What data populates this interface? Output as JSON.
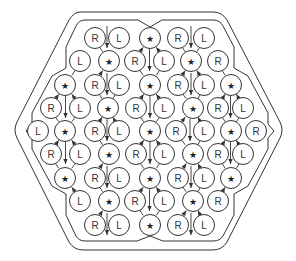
{
  "diagram": {
    "title": "",
    "colors": {
      "stroke": "#333333",
      "fill": "#ffffff",
      "text": "#333333"
    },
    "circle_radius": 10.5,
    "rows": [
      {
        "y": 38,
        "cells": [
          {
            "x": 95,
            "t": "R"
          },
          {
            "x": 119,
            "t": "L"
          },
          {
            "x": 150,
            "t": "★"
          },
          {
            "x": 178,
            "t": "R"
          },
          {
            "x": 204,
            "t": "L"
          }
        ]
      },
      {
        "y": 61,
        "cells": [
          {
            "x": 80,
            "t": "L"
          },
          {
            "x": 109,
            "t": "★"
          },
          {
            "x": 135,
            "t": "R"
          },
          {
            "x": 164,
            "t": "L"
          },
          {
            "x": 191,
            "t": "★"
          },
          {
            "x": 218,
            "t": "R"
          }
        ]
      },
      {
        "y": 85,
        "cells": [
          {
            "x": 65,
            "t": "★"
          },
          {
            "x": 95,
            "t": "R"
          },
          {
            "x": 119,
            "t": "L"
          },
          {
            "x": 150,
            "t": "★"
          },
          {
            "x": 178,
            "t": "R"
          },
          {
            "x": 204,
            "t": "L"
          },
          {
            "x": 231,
            "t": "★"
          }
        ]
      },
      {
        "y": 108,
        "cells": [
          {
            "x": 51,
            "t": "R"
          },
          {
            "x": 80,
            "t": "L"
          },
          {
            "x": 108,
            "t": "★"
          },
          {
            "x": 136,
            "t": "R"
          },
          {
            "x": 164,
            "t": "L"
          },
          {
            "x": 193,
            "t": "★"
          },
          {
            "x": 218,
            "t": "R"
          },
          {
            "x": 243,
            "t": "L"
          }
        ]
      },
      {
        "y": 131,
        "cells": [
          {
            "x": 38,
            "t": "L"
          },
          {
            "x": 65,
            "t": "★"
          },
          {
            "x": 95,
            "t": "R"
          },
          {
            "x": 119,
            "t": "L"
          },
          {
            "x": 150,
            "t": "★"
          },
          {
            "x": 176,
            "t": "R"
          },
          {
            "x": 204,
            "t": "L"
          },
          {
            "x": 231,
            "t": "★"
          },
          {
            "x": 256,
            "t": "R"
          }
        ]
      },
      {
        "y": 154,
        "cells": [
          {
            "x": 51,
            "t": "R"
          },
          {
            "x": 80,
            "t": "L"
          },
          {
            "x": 109,
            "t": "★"
          },
          {
            "x": 136,
            "t": "R"
          },
          {
            "x": 164,
            "t": "L"
          },
          {
            "x": 193,
            "t": "★"
          },
          {
            "x": 218,
            "t": "R"
          },
          {
            "x": 243,
            "t": "L"
          }
        ]
      },
      {
        "y": 178,
        "cells": [
          {
            "x": 65,
            "t": "★"
          },
          {
            "x": 95,
            "t": "R"
          },
          {
            "x": 119,
            "t": "L"
          },
          {
            "x": 150,
            "t": "★"
          },
          {
            "x": 178,
            "t": "R"
          },
          {
            "x": 204,
            "t": "L"
          },
          {
            "x": 231,
            "t": "★"
          }
        ]
      },
      {
        "y": 201,
        "cells": [
          {
            "x": 80,
            "t": "L"
          },
          {
            "x": 109,
            "t": "★"
          },
          {
            "x": 135,
            "t": "R"
          },
          {
            "x": 164,
            "t": "L"
          },
          {
            "x": 193,
            "t": "★"
          },
          {
            "x": 218,
            "t": "R"
          }
        ]
      },
      {
        "y": 225,
        "cells": [
          {
            "x": 95,
            "t": "R"
          },
          {
            "x": 119,
            "t": "L"
          },
          {
            "x": 150,
            "t": "★"
          },
          {
            "x": 178,
            "t": "R"
          },
          {
            "x": 204,
            "t": "L"
          }
        ]
      }
    ],
    "legend": {
      "R": "R",
      "L": "L",
      "star": "★"
    },
    "outer_border": "M80,12 L213,12 Q222,12 227,20 L280,122 Q284,130 280,138 L227,242 Q222,250 213,250 L83,250 Q74,250 69,242 L17,138 Q13,130 17,122 L69,20 Q74,12 80,12 Z",
    "inner_border": "M85,20 L138,20 L150,27 L162,20 L213,20 Q220,20 223,26 L234,47 L234,68 L248,76 L268,113 L268,124 L274,131 L268,138 L268,149 L248,186 L234,194 L234,215 L223,236 Q220,241 213,241 L163,241 L150,236 L137,241 L85,241 Q79,241 76,236 L66,215 L66,194 L52,186 L32,149 L32,138 L26,131 L32,124 L32,113 L52,76 L66,68 L66,47 L76,26 Q79,20 85,20 Z"
  }
}
